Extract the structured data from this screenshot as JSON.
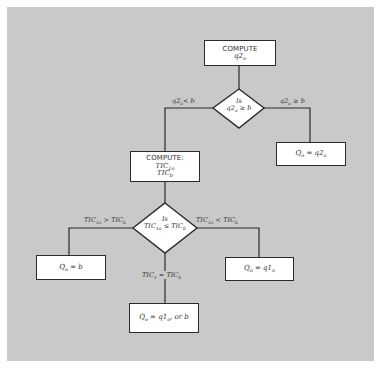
{
  "diagram": {
    "type": "flowchart",
    "background_color": "#c9c9c9",
    "node_fill": "#ffffff",
    "stroke_color": "#2a2a2a",
    "nodes": {
      "compute_q2": {
        "shape": "rect",
        "line1": "COMPUTE",
        "var": "q2",
        "var_sub": "o"
      },
      "decision_q2": {
        "shape": "diamond",
        "line1": "Is",
        "expr_var": "q2",
        "expr_sub": "o",
        "expr_rest": " ≥ b"
      },
      "result_q2": {
        "shape": "rect",
        "lhs": "Q",
        "lhs_sub": "o",
        "eq": " = ",
        "rhs": "q2",
        "rhs_sub": "o"
      },
      "compute_tic": {
        "shape": "rect",
        "line1": "COMPUTE:",
        "tic1": "TIC",
        "tic1_sub": "1o",
        "ticb": "TIC",
        "ticb_sub": "b"
      },
      "decision_tic": {
        "shape": "diamond",
        "line1": "Is",
        "expr_a": "TIC",
        "expr_a_sub": "1o",
        "expr_op": " ≤ ",
        "expr_b": "TIC",
        "expr_b_sub": "b"
      },
      "result_b": {
        "shape": "rect",
        "lhs": "Q",
        "lhs_sub": "o",
        "eq": " = ",
        "rhs": "b"
      },
      "result_q1": {
        "shape": "rect",
        "lhs": "Q",
        "lhs_sub": "o",
        "eq": " = ",
        "rhs": "q1",
        "rhs_sub": "o"
      },
      "result_either": {
        "shape": "rect",
        "lhs": "Q",
        "lhs_sub": "o",
        "eq": " = ",
        "rhs": "q1",
        "rhs_sub": "o",
        "tail": ", or b"
      }
    },
    "edges": {
      "q2_less": {
        "from": "decision_q2",
        "to": "compute_tic",
        "var": "q2",
        "sub": "o",
        "rest": "< b"
      },
      "q2_geq": {
        "from": "decision_q2",
        "to": "result_q2",
        "var": "q2",
        "sub": "o",
        "rest": " ≥ b"
      },
      "tic_greater": {
        "from": "decision_tic",
        "to": "result_b",
        "a": "TIC",
        "a_sub": "1o",
        "op": " > ",
        "b": "TIC",
        "b_sub": "b"
      },
      "tic_less": {
        "from": "decision_tic",
        "to": "result_q1",
        "a": "TIC",
        "a_sub": "1o",
        "op": " < ",
        "b": "TIC",
        "b_sub": "b"
      },
      "tic_equal": {
        "from": "decision_tic",
        "to": "result_either",
        "a": "TIC",
        "a_sub": "1",
        "op": " = ",
        "b": "TIC",
        "b_sub": "b"
      }
    }
  }
}
